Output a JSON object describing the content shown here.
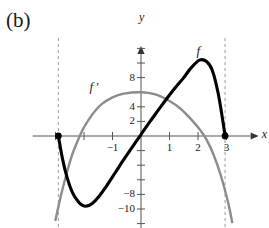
{
  "panel": {
    "label": "(b)"
  },
  "axes": {
    "x_label": "x",
    "y_label": "y",
    "origin_px": {
      "x": 141,
      "y": 136
    },
    "x_scale_px_per_unit": 28.5,
    "y_scale_px_per_unit": 7.3,
    "x_tick_labels": [
      {
        "text": "-1",
        "value": -1
      },
      {
        "text": "1",
        "value": 1
      },
      {
        "text": "2",
        "value": 2
      },
      {
        "text": "3",
        "value": 3
      }
    ],
    "y_tick_labels": [
      {
        "text": "8",
        "value": 8
      },
      {
        "text": "4",
        "value": 4
      },
      {
        "text": "2",
        "value": 2
      },
      {
        "text": "-8",
        "value": -8
      },
      {
        "text": "-10",
        "value": -10
      }
    ]
  },
  "curve_labels": [
    {
      "name": "f-label",
      "text": "f"
    },
    {
      "name": "f-prime-label",
      "text": "f ′"
    }
  ],
  "colors": {
    "curve_f": "#000000",
    "curve_f_prime": "#8c8c8c",
    "axis": "#555555",
    "dashed_line": "#9a9a9a",
    "text": "#1a1a1a",
    "background": "#ffffff"
  },
  "chart_data": {
    "type": "line",
    "title": "",
    "xlabel": "x",
    "ylabel": "y",
    "grid": false,
    "legend": "inline-curve-labels",
    "xlim": [
      -3.8,
      4.2
    ],
    "ylim": [
      -12.6,
      12.6
    ],
    "x_ticks": [
      -1,
      1,
      2,
      3
    ],
    "y_ticks": [
      8,
      4,
      2,
      -8,
      -10
    ],
    "series": [
      {
        "name": "f",
        "color": "#000000",
        "style": "solid-thick",
        "domain": [
          -2.9,
          2.95
        ],
        "points": [
          {
            "x": -2.9,
            "y": 0.0
          },
          {
            "x": -2.75,
            "y": -3.2
          },
          {
            "x": -2.6,
            "y": -5.6
          },
          {
            "x": -2.4,
            "y": -7.8
          },
          {
            "x": -2.2,
            "y": -9.0
          },
          {
            "x": -2.05,
            "y": -9.5
          },
          {
            "x": -1.9,
            "y": -9.6
          },
          {
            "x": -1.7,
            "y": -9.2
          },
          {
            "x": -1.5,
            "y": -8.4
          },
          {
            "x": -1.2,
            "y": -6.8
          },
          {
            "x": -0.9,
            "y": -5.0
          },
          {
            "x": -0.6,
            "y": -3.2
          },
          {
            "x": -0.3,
            "y": -1.5
          },
          {
            "x": 0.0,
            "y": 0.2
          },
          {
            "x": 0.3,
            "y": 1.9
          },
          {
            "x": 0.6,
            "y": 3.5
          },
          {
            "x": 0.9,
            "y": 5.1
          },
          {
            "x": 1.2,
            "y": 6.6
          },
          {
            "x": 1.5,
            "y": 8.0
          },
          {
            "x": 1.75,
            "y": 9.3
          },
          {
            "x": 2.05,
            "y": 10.4
          },
          {
            "x": 2.3,
            "y": 10.2
          },
          {
            "x": 2.5,
            "y": 9.0
          },
          {
            "x": 2.7,
            "y": 6.0
          },
          {
            "x": 2.85,
            "y": 2.6
          },
          {
            "x": 2.95,
            "y": 0.0
          }
        ],
        "endpoint_dots": [
          {
            "x": -2.9,
            "y": 0.0
          },
          {
            "x": 2.95,
            "y": 0.0
          }
        ]
      },
      {
        "name": "f'",
        "color": "#8c8c8c",
        "style": "solid-medium",
        "domain": [
          -3.0,
          3.2
        ],
        "points": [
          {
            "x": -3.0,
            "y": -11.5
          },
          {
            "x": -2.8,
            "y": -8.0
          },
          {
            "x": -2.6,
            "y": -5.0
          },
          {
            "x": -2.4,
            "y": -2.4
          },
          {
            "x": -2.15,
            "y": 0.0
          },
          {
            "x": -2.0,
            "y": 1.2
          },
          {
            "x": -1.7,
            "y": 3.0
          },
          {
            "x": -1.4,
            "y": 4.3
          },
          {
            "x": -1.0,
            "y": 5.3
          },
          {
            "x": -0.6,
            "y": 5.8
          },
          {
            "x": 0.0,
            "y": 6.0
          },
          {
            "x": 0.5,
            "y": 5.7
          },
          {
            "x": 1.0,
            "y": 4.8
          },
          {
            "x": 1.4,
            "y": 3.7
          },
          {
            "x": 1.8,
            "y": 2.1
          },
          {
            "x": 2.1,
            "y": 0.7
          },
          {
            "x": 2.3,
            "y": -0.5
          },
          {
            "x": 2.55,
            "y": -2.6
          },
          {
            "x": 2.8,
            "y": -5.4
          },
          {
            "x": 3.05,
            "y": -9.0
          },
          {
            "x": 3.2,
            "y": -11.8
          }
        ],
        "endpoint_dots": []
      }
    ],
    "annotations": [
      {
        "name": "dashed-vertical-left",
        "type": "vertical-dashed",
        "x": -2.9
      },
      {
        "name": "dashed-vertical-right",
        "type": "vertical-dashed",
        "x": 2.95
      },
      {
        "name": "f-label",
        "text": "f",
        "x": 2.05,
        "y": 11.5
      },
      {
        "name": "f-prime-label",
        "text": "f′",
        "x": -1.6,
        "y": 6.6
      }
    ]
  }
}
